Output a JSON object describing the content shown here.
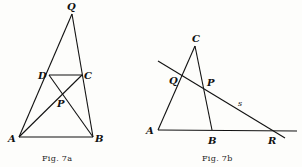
{
  "figures": [
    {
      "id": "fig7a",
      "caption": "Fig. 7a",
      "points": {
        "Q": {
          "label": "Q",
          "x": 72,
          "y": 14
        },
        "D": {
          "label": "D",
          "x": 49,
          "y": 75
        },
        "C": {
          "label": "C",
          "x": 82,
          "y": 75
        },
        "A": {
          "label": "A",
          "x": 19,
          "y": 137
        },
        "B": {
          "label": "B",
          "x": 93,
          "y": 137
        },
        "P": {
          "label": "P",
          "x": 64,
          "y": 97
        }
      },
      "segments": [
        [
          "A",
          "Q"
        ],
        [
          "B",
          "Q"
        ],
        [
          "D",
          "C"
        ],
        [
          "A",
          "B"
        ],
        [
          "A",
          "C"
        ],
        [
          "D",
          "B"
        ]
      ]
    },
    {
      "id": "fig7b",
      "caption": "Fig. 7b",
      "points": {
        "C": {
          "label": "C",
          "x": 195,
          "y": 46
        },
        "Q": {
          "label": "Q",
          "x": 180,
          "y": 77
        },
        "P": {
          "label": "P",
          "x": 204,
          "y": 89
        },
        "A": {
          "label": "A",
          "x": 158,
          "y": 130
        },
        "B": {
          "label": "B",
          "x": 212,
          "y": 130
        },
        "R": {
          "label": "R",
          "x": 272,
          "y": 130
        }
      },
      "line_label": "s",
      "segments": [
        [
          "A",
          "C"
        ],
        [
          "C",
          "B"
        ],
        [
          "A",
          "R-extended"
        ],
        [
          "s-line"
        ]
      ]
    }
  ]
}
